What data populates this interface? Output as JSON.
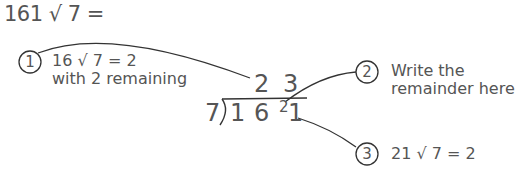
{
  "problem": "161 √ 7 =",
  "steps": [
    {
      "number": "1",
      "lines": [
        "16 √ 7 = 2",
        "with 2 remaining"
      ]
    },
    {
      "number": "2",
      "lines": [
        "Write the",
        "remainder here"
      ]
    },
    {
      "number": "3",
      "lines": [
        "21 √ 7 = 2"
      ]
    }
  ],
  "division": {
    "divisor": "7",
    "dividend_digits": [
      "1",
      "6",
      "1"
    ],
    "carried_remainder": "2",
    "quotient": "2 3"
  },
  "colors": {
    "ink": "#555555",
    "lines": "#333333"
  }
}
